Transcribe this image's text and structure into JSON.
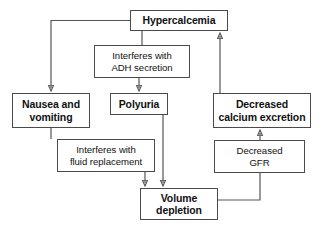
{
  "diagram": {
    "type": "flowchart",
    "background_color": "#ffffff",
    "box_border_color": "#4a4a4a",
    "edge_color": "#555555",
    "text_color": "#111111",
    "nodes": [
      {
        "id": "hypercalcemia",
        "label": "Hypercalcemia",
        "lines": [
          "Hypercalcemia"
        ],
        "style": "primary",
        "x": 130,
        "y": 10,
        "w": 98,
        "h": 21
      },
      {
        "id": "adh",
        "label": "Interferes with ADH secretion",
        "lines": [
          "Interferes with",
          "ADH secretion"
        ],
        "style": "label-node",
        "x": 94,
        "y": 45,
        "w": 96,
        "h": 33
      },
      {
        "id": "nausea",
        "label": "Nausea and vomiting",
        "lines": [
          "Nausea and",
          "vomiting"
        ],
        "style": "primary",
        "x": 12,
        "y": 93,
        "w": 78,
        "h": 35
      },
      {
        "id": "polyuria",
        "label": "Polyuria",
        "lines": [
          "Polyuria"
        ],
        "style": "primary",
        "x": 110,
        "y": 93,
        "w": 58,
        "h": 22
      },
      {
        "id": "calcium",
        "label": "Decreased calcium excretion",
        "lines": [
          "Decreased",
          "calcium excretion"
        ],
        "style": "primary",
        "x": 213,
        "y": 93,
        "w": 98,
        "h": 35
      },
      {
        "id": "fluid",
        "label": "Interferes with fluid replacement",
        "lines": [
          "Interferes with",
          "fluid replacement"
        ],
        "style": "label-node",
        "x": 57,
        "y": 139,
        "w": 98,
        "h": 33
      },
      {
        "id": "gfr",
        "label": "Decreased GFR",
        "lines": [
          "Decreased",
          "GFR"
        ],
        "style": "label-node",
        "x": 214,
        "y": 140,
        "w": 91,
        "h": 33
      },
      {
        "id": "volume",
        "label": "Volume depletion",
        "lines": [
          "Volume",
          "depletion"
        ],
        "style": "primary",
        "x": 140,
        "y": 188,
        "w": 78,
        "h": 32
      }
    ],
    "edges": [
      {
        "id": "hypercalcemia-to-nausea",
        "from": "hypercalcemia",
        "to": "nausea",
        "arrow": true
      },
      {
        "id": "hypercalcemia-to-adh",
        "from": "hypercalcemia",
        "to": "adh",
        "arrow": false
      },
      {
        "id": "adh-to-polyuria",
        "from": "adh",
        "to": "polyuria",
        "arrow": true
      },
      {
        "id": "nausea-to-fluid",
        "from": "nausea",
        "to": "fluid",
        "arrow": false
      },
      {
        "id": "fluid-to-volume",
        "from": "fluid",
        "to": "volume",
        "arrow": true
      },
      {
        "id": "polyuria-to-volume",
        "from": "polyuria",
        "to": "volume",
        "arrow": true
      },
      {
        "id": "volume-to-gfr",
        "from": "volume",
        "to": "gfr",
        "arrow": false
      },
      {
        "id": "gfr-to-calcium",
        "from": "gfr",
        "to": "calcium",
        "arrow": true
      },
      {
        "id": "calcium-to-hypercalcemia",
        "from": "calcium",
        "to": "hypercalcemia",
        "arrow": true
      }
    ]
  }
}
